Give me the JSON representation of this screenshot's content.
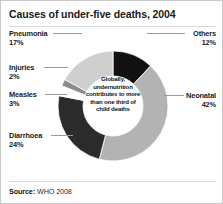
{
  "card": {
    "title": "Causes of under-five deaths, 2004",
    "source_label": "Source:",
    "source_value": "WHO 2008"
  },
  "center_note": "Globally, undernutrition contributes to more than one third of child deaths",
  "labels": {
    "pneumonia": {
      "name": "Pneumonia",
      "percent": "17%"
    },
    "injuries": {
      "name": "Injuries",
      "percent": "2%"
    },
    "measles": {
      "name": "Measles",
      "percent": "3%"
    },
    "diarrhoea": {
      "name": "Diarrhoea",
      "percent": "24%"
    },
    "others": {
      "name": "Others",
      "percent": "12%"
    },
    "neonatal": {
      "name": "Neonatal",
      "percent": "42%"
    }
  },
  "chart_data": {
    "type": "pie",
    "title": "Causes of under-five deaths, 2004",
    "subtitle": "",
    "xlabel": "",
    "ylabel": "",
    "units": "percent",
    "donut": true,
    "inner_radius_ratio": 0.55,
    "start_angle_deg": 0,
    "direction": "clockwise",
    "legend": "callout-labels",
    "grid": false,
    "annotation": "Globally, undernutrition contributes to more than one third of child deaths",
    "source": "Source: WHO 2008",
    "categories": [
      "Others",
      "Neonatal",
      "Diarrhoea",
      "Measles",
      "Injuries",
      "Pneumonia"
    ],
    "values": [
      12,
      42,
      24,
      3,
      2,
      17
    ],
    "colors": [
      "#111111",
      "#b3b3b3",
      "#2b2b2b",
      "#ffffff",
      "#8c8c8c",
      "#cfcfcf"
    ],
    "slices": [
      {
        "label": "Others",
        "value": 12,
        "color": "#111111"
      },
      {
        "label": "Neonatal",
        "value": 42,
        "color": "#b3b3b3"
      },
      {
        "label": "Diarrhoea",
        "value": 24,
        "color": "#2b2b2b"
      },
      {
        "label": "Measles",
        "value": 3,
        "color": "#ffffff"
      },
      {
        "label": "Injuries",
        "value": 2,
        "color": "#8c8c8c"
      },
      {
        "label": "Pneumonia",
        "value": 17,
        "color": "#cfcfcf"
      }
    ]
  },
  "geometry": {
    "cx": 112,
    "cy": 79,
    "outer_r": 55,
    "inner_r": 30
  }
}
